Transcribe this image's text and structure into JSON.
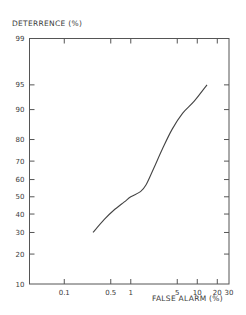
{
  "chart_data": {
    "type": "line",
    "title": "",
    "ylabel": "DETERRENCE (%)",
    "xlabel": "FALSE ALARM (%)",
    "x_scale": "log",
    "y_scale": "normal-probability",
    "xlim": [
      0.03,
      30
    ],
    "ylim": [
      10,
      99
    ],
    "x_ticks": [
      {
        "value": 0.1,
        "label": "0.1"
      },
      {
        "value": 0.5,
        "label": "0.5"
      },
      {
        "value": 1,
        "label": "1"
      },
      {
        "value": 5,
        "label": "5"
      },
      {
        "value": 10,
        "label": "10"
      },
      {
        "value": 20,
        "label": "20"
      },
      {
        "value": 30,
        "label": "30"
      }
    ],
    "y_ticks": [
      {
        "value": 10,
        "label": "10"
      },
      {
        "value": 20,
        "label": "20"
      },
      {
        "value": 30,
        "label": "30"
      },
      {
        "value": 40,
        "label": "40"
      },
      {
        "value": 50,
        "label": "50"
      },
      {
        "value": 60,
        "label": "60"
      },
      {
        "value": 70,
        "label": "70"
      },
      {
        "value": 80,
        "label": "80"
      },
      {
        "value": 90,
        "label": "90"
      },
      {
        "value": 95,
        "label": "95"
      },
      {
        "value": 99,
        "label": "99"
      }
    ],
    "grid": false,
    "legend": "none",
    "series": [
      {
        "name": "deterrence-vs-false-alarm",
        "points": [
          {
            "x": 0.27,
            "y": 30
          },
          {
            "x": 0.4,
            "y": 37
          },
          {
            "x": 0.55,
            "y": 42
          },
          {
            "x": 0.8,
            "y": 47
          },
          {
            "x": 1.0,
            "y": 50
          },
          {
            "x": 1.4,
            "y": 53
          },
          {
            "x": 1.7,
            "y": 57
          },
          {
            "x": 2.2,
            "y": 66
          },
          {
            "x": 3.0,
            "y": 76
          },
          {
            "x": 4.2,
            "y": 84
          },
          {
            "x": 6.0,
            "y": 89
          },
          {
            "x": 9.0,
            "y": 92
          },
          {
            "x": 14.0,
            "y": 95
          }
        ]
      }
    ]
  }
}
